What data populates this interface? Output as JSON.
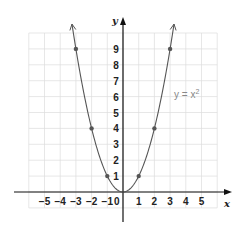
{
  "chart_data": {
    "type": "line",
    "title": "",
    "function_label": "y = x",
    "function_exponent": "2",
    "xlabel": "x",
    "ylabel": "y",
    "xlim": [
      -6,
      6
    ],
    "ylim": [
      -1,
      10
    ],
    "grid": true,
    "x_ticks": [
      -5,
      -4,
      -3,
      -2,
      -1,
      1,
      2,
      3,
      4,
      5
    ],
    "x_tick_labels": [
      "−5",
      "−4",
      "−3",
      "−2",
      "−1",
      "1",
      "2",
      "3",
      "4",
      "5"
    ],
    "y_ticks": [
      1,
      2,
      3,
      4,
      5,
      6,
      7,
      8,
      9
    ],
    "y_tick_labels": [
      "1",
      "2",
      "3",
      "4",
      "5",
      "6",
      "7",
      "8",
      "9"
    ],
    "origin_label": "0",
    "points": [
      {
        "x": -3,
        "y": 9
      },
      {
        "x": -2,
        "y": 4
      },
      {
        "x": -1,
        "y": 1
      },
      {
        "x": 0,
        "y": 0
      },
      {
        "x": 1,
        "y": 1
      },
      {
        "x": 2,
        "y": 4
      },
      {
        "x": 3,
        "y": 9
      }
    ],
    "series": [
      {
        "name": "y = x^2",
        "x": [
          -3.2,
          -3,
          -2,
          -1,
          0,
          1,
          2,
          3,
          3.2
        ],
        "values": [
          10.24,
          9,
          4,
          1,
          0,
          1,
          4,
          9,
          10.24
        ]
      }
    ]
  },
  "colors": {
    "grid": "#dcdcdc",
    "axis": "#111111",
    "curve": "#555555",
    "point": "#555555",
    "equation": "#888888"
  }
}
